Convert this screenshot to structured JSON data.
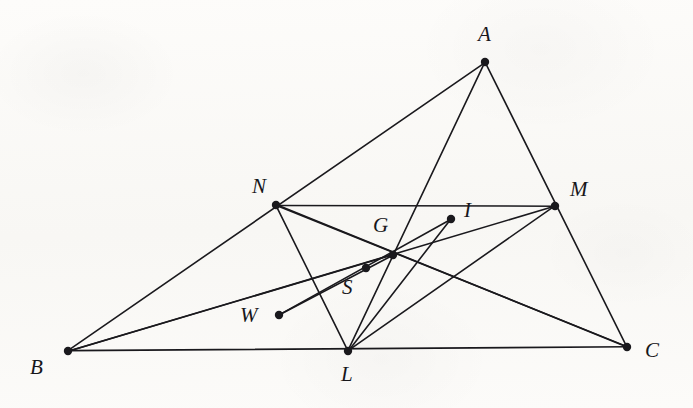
{
  "figure": {
    "kind": "geometry-diagram",
    "background_color": "#fbfaf8",
    "ink_color": "#1a191d",
    "stroke_width": 1.6,
    "vertex_dot_radius": 4.2,
    "canvas": {
      "width": 693,
      "height": 408
    }
  },
  "points": [
    {
      "id": "A",
      "label": "A",
      "x": 485,
      "y": 62,
      "label_x": 478,
      "label_y": 24,
      "dot": true
    },
    {
      "id": "B",
      "label": "B",
      "x": 68,
      "y": 351,
      "label_x": 30,
      "label_y": 357,
      "dot": true
    },
    {
      "id": "C",
      "label": "C",
      "x": 627,
      "y": 347,
      "label_x": 645,
      "label_y": 340,
      "dot": true
    },
    {
      "id": "N",
      "label": "N",
      "x": 276,
      "y": 205,
      "label_x": 252,
      "label_y": 176,
      "dot": true
    },
    {
      "id": "M",
      "label": "M",
      "x": 555,
      "y": 206,
      "label_x": 570,
      "label_y": 179,
      "dot": true
    },
    {
      "id": "L",
      "label": "L",
      "x": 348,
      "y": 351,
      "label_x": 341,
      "label_y": 364,
      "dot": true
    },
    {
      "id": "G",
      "label": "G",
      "x": 393,
      "y": 255,
      "label_x": 373,
      "label_y": 215,
      "dot": true
    },
    {
      "id": "I",
      "label": "I",
      "x": 451,
      "y": 219,
      "label_x": 464,
      "label_y": 200,
      "dot": true
    },
    {
      "id": "S",
      "label": "S",
      "x": 366,
      "y": 268,
      "label_x": 342,
      "label_y": 277,
      "dot": true
    },
    {
      "id": "W",
      "label": "W",
      "x": 279,
      "y": 315,
      "label_x": 240,
      "label_y": 305,
      "dot": true
    }
  ],
  "segments": [
    {
      "id": "seg-BC",
      "from": "B",
      "to": "C",
      "name": "side-bc"
    },
    {
      "id": "seg-BA",
      "from": "B",
      "to": "A",
      "name": "side-ba"
    },
    {
      "id": "seg-AC",
      "from": "A",
      "to": "C",
      "name": "side-ac"
    },
    {
      "id": "seg-NM",
      "from": "N",
      "to": "M",
      "name": "midline-nm"
    },
    {
      "id": "seg-NL",
      "from": "N",
      "to": "L",
      "name": "midline-nl"
    },
    {
      "id": "seg-LM",
      "from": "L",
      "to": "M",
      "name": "midline-lm"
    },
    {
      "id": "seg-AL",
      "from": "A",
      "to": "L",
      "name": "median-al"
    },
    {
      "id": "seg-BM",
      "from": "B",
      "to": "M",
      "name": "median-bm"
    },
    {
      "id": "seg-CN",
      "from": "C",
      "to": "N",
      "name": "median-cn"
    },
    {
      "id": "seg-NC2",
      "from": "N",
      "to": "C",
      "name": "cevian-nc"
    },
    {
      "id": "seg-LI",
      "from": "L",
      "to": "I",
      "name": "cevian-li"
    },
    {
      "id": "seg-WI",
      "from": "W",
      "to": "I",
      "name": "cevian-wi"
    },
    {
      "id": "seg-WG",
      "from": "W",
      "to": "G",
      "name": "cevian-wg"
    },
    {
      "id": "seg-BG",
      "from": "B",
      "to": "G",
      "name": "cevian-bg"
    }
  ],
  "notes": {
    "medial_triangle": "LMN",
    "centroid_label": "G",
    "extra_points": [
      "I",
      "S",
      "W"
    ]
  }
}
